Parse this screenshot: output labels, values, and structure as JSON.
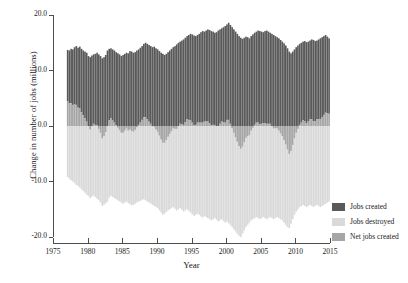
{
  "chart_data": {
    "type": "bar",
    "title": "",
    "subtitle": "",
    "xlabel": "Year",
    "ylabel": "Change in number of jobs (millions)",
    "xlim": [
      1975,
      2015
    ],
    "ylim": [
      -20.0,
      20.0
    ],
    "grid": false,
    "legend_position": "right",
    "stacked": true,
    "bar_frequency": "quarterly",
    "x_tick_labels": [
      "1975",
      "1980",
      "1985",
      "1990",
      "1995",
      "2000",
      "2005",
      "2010",
      "2015"
    ],
    "x_tick_values": [
      1975,
      1980,
      1985,
      1990,
      1995,
      2000,
      2005,
      2010,
      2015
    ],
    "y_tick_labels": [
      "20.0",
      "10.0",
      "0.0",
      "-10.0",
      "-20.0"
    ],
    "y_tick_values": [
      20.0,
      10.0,
      0.0,
      -10.0,
      -20.0
    ],
    "colors": {
      "jobs_created": "#595959",
      "jobs_destroyed": "#d9d9d9",
      "net_jobs_created": "#a6a6a6",
      "axis": "#4d4d4d",
      "text": "#1a1a1a",
      "background": "#ffffff"
    },
    "legend": [
      {
        "label": "Jobs created",
        "color": "#595959"
      },
      {
        "label": "Jobs destroyed",
        "color": "#d9d9d9"
      },
      {
        "label": "Net jobs created",
        "color": "#a6a6a6"
      }
    ],
    "x": [
      1977.0,
      1977.25,
      1977.5,
      1977.75,
      1978.0,
      1978.25,
      1978.5,
      1978.75,
      1979.0,
      1979.25,
      1979.5,
      1979.75,
      1980.0,
      1980.25,
      1980.5,
      1980.75,
      1981.0,
      1981.25,
      1981.5,
      1981.75,
      1982.0,
      1982.25,
      1982.5,
      1982.75,
      1983.0,
      1983.25,
      1983.5,
      1983.75,
      1984.0,
      1984.25,
      1984.5,
      1984.75,
      1985.0,
      1985.25,
      1985.5,
      1985.75,
      1986.0,
      1986.25,
      1986.5,
      1986.75,
      1987.0,
      1987.25,
      1987.5,
      1987.75,
      1988.0,
      1988.25,
      1988.5,
      1988.75,
      1989.0,
      1989.25,
      1989.5,
      1989.75,
      1990.0,
      1990.25,
      1990.5,
      1990.75,
      1991.0,
      1991.25,
      1991.5,
      1991.75,
      1992.0,
      1992.25,
      1992.5,
      1992.75,
      1993.0,
      1993.25,
      1993.5,
      1993.75,
      1994.0,
      1994.25,
      1994.5,
      1994.75,
      1995.0,
      1995.25,
      1995.5,
      1995.75,
      1996.0,
      1996.25,
      1996.5,
      1996.75,
      1997.0,
      1997.25,
      1997.5,
      1997.75,
      1998.0,
      1998.25,
      1998.5,
      1998.75,
      1999.0,
      1999.25,
      1999.5,
      1999.75,
      2000.0,
      2000.25,
      2000.5,
      2000.75,
      2001.0,
      2001.25,
      2001.5,
      2001.75,
      2002.0,
      2002.25,
      2002.5,
      2002.75,
      2003.0,
      2003.25,
      2003.5,
      2003.75,
      2004.0,
      2004.25,
      2004.5,
      2004.75,
      2005.0,
      2005.25,
      2005.5,
      2005.75,
      2006.0,
      2006.25,
      2006.5,
      2006.75,
      2007.0,
      2007.25,
      2007.5,
      2007.75,
      2008.0,
      2008.25,
      2008.5,
      2008.75,
      2009.0,
      2009.25,
      2009.5,
      2009.75,
      2010.0,
      2010.25,
      2010.5,
      2010.75,
      2011.0,
      2011.25,
      2011.5,
      2011.75,
      2012.0,
      2012.25,
      2012.5,
      2012.75,
      2013.0,
      2013.25,
      2013.5,
      2013.75,
      2014.0,
      2014.25,
      2014.5,
      2014.75
    ],
    "series": [
      {
        "name": "Jobs created",
        "color": "#595959",
        "values": [
          13.7,
          13.6,
          13.9,
          13.8,
          14.2,
          14.4,
          14.1,
          14.3,
          13.9,
          13.6,
          13.4,
          13.2,
          12.6,
          12.4,
          12.7,
          12.9,
          13.0,
          13.2,
          12.9,
          12.6,
          12.2,
          12.4,
          12.8,
          13.6,
          13.9,
          14.0,
          13.8,
          13.6,
          13.3,
          13.1,
          12.9,
          12.6,
          12.8,
          13.0,
          13.2,
          13.1,
          13.5,
          13.4,
          13.2,
          13.3,
          13.6,
          13.8,
          14.1,
          14.4,
          14.8,
          15.0,
          14.8,
          14.6,
          14.4,
          14.2,
          14.3,
          14.0,
          13.8,
          13.5,
          13.2,
          13.0,
          12.8,
          13.0,
          13.3,
          13.6,
          13.9,
          14.2,
          14.4,
          14.7,
          15.0,
          15.2,
          15.4,
          15.6,
          15.9,
          16.2,
          16.4,
          16.6,
          16.5,
          16.3,
          16.2,
          16.4,
          16.6,
          16.9,
          17.1,
          17.0,
          17.2,
          17.4,
          17.3,
          17.1,
          17.0,
          16.8,
          16.9,
          17.2,
          17.4,
          17.6,
          17.8,
          18.0,
          18.3,
          18.6,
          18.2,
          17.8,
          17.4,
          17.0,
          16.6,
          16.2,
          15.9,
          15.7,
          15.9,
          16.1,
          16.0,
          15.8,
          16.2,
          16.5,
          16.8,
          17.0,
          17.2,
          17.1,
          17.0,
          16.9,
          17.1,
          17.2,
          17.0,
          16.8,
          16.6,
          16.4,
          16.2,
          16.0,
          15.8,
          15.5,
          15.2,
          14.9,
          14.5,
          14.0,
          13.4,
          13.1,
          13.4,
          13.8,
          14.2,
          14.5,
          14.8,
          15.0,
          15.2,
          15.3,
          15.1,
          15.2,
          15.4,
          15.6,
          15.5,
          15.3,
          15.4,
          15.6,
          15.8,
          16.0,
          16.2,
          16.4,
          16.1,
          15.8
        ]
      },
      {
        "name": "Jobs destroyed",
        "color": "#d9d9d9",
        "values": [
          -9.2,
          -9.5,
          -9.8,
          -10.0,
          -10.3,
          -10.6,
          -10.8,
          -11.1,
          -11.4,
          -11.7,
          -12.0,
          -12.4,
          -12.6,
          -13.0,
          -12.7,
          -12.5,
          -12.8,
          -13.1,
          -13.4,
          -13.8,
          -14.4,
          -14.2,
          -13.9,
          -13.6,
          -12.9,
          -12.6,
          -12.8,
          -13.0,
          -13.2,
          -13.4,
          -13.6,
          -13.8,
          -14.0,
          -13.8,
          -13.6,
          -13.9,
          -14.1,
          -14.3,
          -14.2,
          -14.0,
          -13.8,
          -13.6,
          -13.5,
          -13.3,
          -13.2,
          -13.4,
          -13.6,
          -13.8,
          -14.0,
          -14.2,
          -14.4,
          -14.6,
          -14.8,
          -15.2,
          -15.6,
          -16.0,
          -15.8,
          -15.5,
          -15.2,
          -15.0,
          -14.8,
          -14.6,
          -14.9,
          -15.2,
          -15.0,
          -14.8,
          -15.1,
          -15.4,
          -15.2,
          -15.0,
          -15.3,
          -15.6,
          -15.9,
          -16.2,
          -16.0,
          -15.8,
          -16.0,
          -16.3,
          -16.5,
          -16.2,
          -16.4,
          -16.6,
          -16.8,
          -17.0,
          -16.8,
          -16.6,
          -16.9,
          -17.2,
          -17.0,
          -16.8,
          -17.1,
          -17.4,
          -17.2,
          -17.5,
          -17.8,
          -18.2,
          -18.6,
          -19.0,
          -19.4,
          -19.8,
          -20.0,
          -19.4,
          -18.8,
          -18.2,
          -17.8,
          -17.4,
          -17.0,
          -16.8,
          -16.6,
          -16.4,
          -16.6,
          -16.8,
          -16.6,
          -16.4,
          -16.6,
          -16.8,
          -16.6,
          -16.4,
          -16.6,
          -16.8,
          -16.6,
          -16.4,
          -16.6,
          -16.8,
          -17.0,
          -17.4,
          -17.8,
          -18.2,
          -18.4,
          -17.6,
          -16.8,
          -16.0,
          -15.4,
          -15.0,
          -14.6,
          -14.4,
          -14.2,
          -14.4,
          -14.6,
          -14.4,
          -14.2,
          -14.4,
          -14.6,
          -14.4,
          -14.2,
          -14.4,
          -14.6,
          -14.4,
          -14.2,
          -14.0,
          -13.8,
          -13.6
        ]
      },
      {
        "name": "Net jobs created",
        "color": "#a6a6a6",
        "values": [
          4.5,
          4.1,
          4.1,
          3.8,
          3.9,
          3.8,
          3.3,
          3.2,
          2.5,
          1.9,
          1.4,
          0.8,
          0.0,
          -0.6,
          0.0,
          0.4,
          0.2,
          0.1,
          -0.5,
          -1.2,
          -2.2,
          -1.8,
          -1.1,
          0.0,
          1.0,
          1.4,
          1.0,
          0.6,
          0.1,
          -0.3,
          -0.7,
          -1.2,
          -1.2,
          -0.8,
          -0.4,
          -0.8,
          -0.6,
          -0.9,
          -1.0,
          -0.7,
          -0.2,
          0.2,
          0.6,
          1.1,
          1.6,
          1.6,
          1.2,
          0.8,
          0.4,
          0.0,
          -0.1,
          -0.6,
          -1.0,
          -1.7,
          -2.4,
          -3.0,
          -3.0,
          -2.5,
          -1.9,
          -1.4,
          -0.9,
          -0.4,
          -0.5,
          -0.5,
          0.0,
          0.4,
          0.3,
          0.2,
          0.7,
          1.2,
          1.1,
          1.0,
          0.6,
          0.1,
          0.2,
          0.6,
          0.6,
          0.6,
          0.6,
          0.8,
          0.8,
          0.8,
          0.5,
          0.1,
          0.2,
          0.2,
          0.0,
          0.0,
          0.4,
          0.8,
          0.7,
          0.6,
          1.1,
          1.1,
          0.4,
          -0.4,
          -1.2,
          -2.0,
          -2.8,
          -3.6,
          -4.1,
          -3.7,
          -2.9,
          -2.1,
          -1.8,
          -1.6,
          -0.8,
          -0.3,
          0.2,
          0.6,
          0.6,
          0.3,
          0.4,
          0.5,
          0.5,
          0.4,
          0.4,
          0.4,
          0.0,
          -0.4,
          -0.4,
          -0.4,
          -0.8,
          -1.3,
          -1.8,
          -2.5,
          -3.3,
          -4.2,
          -5.0,
          -4.5,
          -3.4,
          -2.2,
          -1.2,
          -0.5,
          0.2,
          0.6,
          1.0,
          0.9,
          0.5,
          0.8,
          1.2,
          1.2,
          0.9,
          0.9,
          1.2,
          1.2,
          1.2,
          1.6,
          2.0,
          2.4,
          2.3,
          2.2
        ]
      }
    ]
  }
}
